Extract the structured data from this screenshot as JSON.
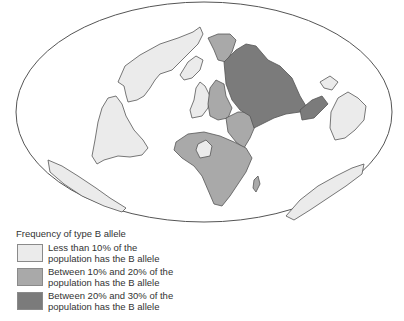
{
  "map": {
    "projection": "elliptical world map",
    "regions": [
      {
        "name": "North America",
        "category": "low"
      },
      {
        "name": "South America",
        "category": "low"
      },
      {
        "name": "Greenland",
        "category": "low"
      },
      {
        "name": "Western Europe",
        "category": "low"
      },
      {
        "name": "Australia",
        "category": "low"
      },
      {
        "name": "Antarctica",
        "category": "low"
      },
      {
        "name": "Eastern Europe / Scandinavia",
        "category": "medium"
      },
      {
        "name": "Africa",
        "category": "medium"
      },
      {
        "name": "Middle East",
        "category": "medium"
      },
      {
        "name": "Siberia (northeast)",
        "category": "medium"
      },
      {
        "name": "Central Asia / Russia",
        "category": "high"
      },
      {
        "name": "South / Southeast Asia",
        "category": "high"
      }
    ],
    "colors": {
      "low": "#ebebeb",
      "medium": "#a9a9a9",
      "high": "#7b7b7b",
      "outline": "#555555",
      "ocean": "#ffffff"
    }
  },
  "legend": {
    "title": "Frequency of type B allele",
    "items": [
      {
        "line1": "Less than 10% of the",
        "line2": "population has the B allele",
        "color": "#ebebeb"
      },
      {
        "line1": "Between 10% and 20% of the",
        "line2": "population has the B allele",
        "color": "#a9a9a9"
      },
      {
        "line1": "Between 20% and 30% of the",
        "line2": "population has the B allele",
        "color": "#7b7b7b"
      }
    ]
  }
}
